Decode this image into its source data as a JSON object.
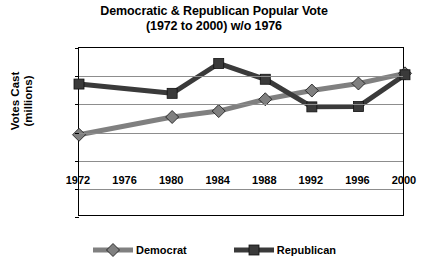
{
  "chart_data": {
    "type": "line",
    "title": "Democratic & Republican Popular Vote",
    "subtitle": "(1972 to 2000) w/o 1976",
    "xlabel": "",
    "ylabel": "Votes Cast",
    "ylabel_line2": "(millions)",
    "x": [
      1972,
      1976,
      1980,
      1984,
      1988,
      1992,
      1996,
      2000
    ],
    "xtick_labels": [
      "1972",
      "1976",
      "1980",
      "1984",
      "1988",
      "1992",
      "1996",
      "2000"
    ],
    "ytick_labels": [
      "60",
      "50",
      "40",
      "30",
      "20",
      "10",
      "0"
    ],
    "ylim": [
      0,
      60
    ],
    "ytick_step": 10,
    "xlim": [
      1972,
      2000
    ],
    "grid": "horizontal",
    "legend_position": "bottom",
    "note": "No data markers plotted at 1976; lines interpolate across that year",
    "series": [
      {
        "name": "Democrat",
        "color": "#808080",
        "marker": "diamond",
        "values": [
          29.2,
          null,
          35.5,
          37.6,
          41.8,
          44.9,
          47.4,
          51.0
        ]
      },
      {
        "name": "Republican",
        "color": "#3a3a3a",
        "marker": "square",
        "values": [
          47.2,
          null,
          43.9,
          54.5,
          48.9,
          39.1,
          39.2,
          50.5
        ]
      }
    ]
  },
  "legend": {
    "items": [
      {
        "label": "Democrat",
        "color": "#808080",
        "marker": "diamond"
      },
      {
        "label": "Republican",
        "color": "#3a3a3a",
        "marker": "square"
      }
    ]
  }
}
